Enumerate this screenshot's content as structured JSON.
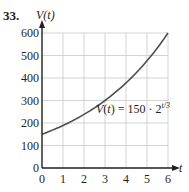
{
  "problem_number": "33.",
  "chart_data": {
    "type": "line",
    "title": "",
    "xlabel": "t",
    "ylabel": "V(t)",
    "xlim": [
      0,
      6
    ],
    "ylim": [
      0,
      600
    ],
    "x_ticks": [
      0,
      1,
      2,
      3,
      4,
      5,
      6
    ],
    "y_ticks": [
      0,
      100,
      200,
      300,
      400,
      500,
      600
    ],
    "grid": true,
    "series": [
      {
        "name": "V(t) = 150 · 2^(t/3)",
        "x": [
          0,
          1,
          2,
          3,
          4,
          5,
          6
        ],
        "values": [
          150,
          189,
          238,
          300,
          378,
          476,
          600
        ]
      }
    ],
    "annotations": [
      "V(t) = 150 · 2^(t/3)"
    ],
    "colors": {
      "curve": "#4d4d4f",
      "grid": "#c8c8c8",
      "axis": "#231f20"
    }
  },
  "labels": {
    "y_axis": "V(t)",
    "x_axis": "t",
    "formula_lhs": "V(t) = 150 · 2",
    "formula_exp": "t/3",
    "yticks": [
      "0",
      "100",
      "200",
      "300",
      "400",
      "500",
      "600"
    ],
    "xticks": [
      "0",
      "1",
      "2",
      "3",
      "4",
      "5",
      "6"
    ]
  }
}
